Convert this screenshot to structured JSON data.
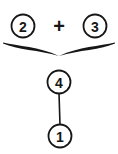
{
  "diagram": {
    "type": "circled-number-tree",
    "background_color": "#ffffff",
    "ink_color": "#161616",
    "canvas": {
      "width": 118,
      "height": 154
    },
    "nodes": [
      {
        "id": "node-2",
        "label": "2",
        "shape": "circle",
        "cx": 23,
        "cy": 26,
        "r": 11.5,
        "stroke_width": 1.8
      },
      {
        "id": "node-3",
        "label": "3",
        "shape": "circle",
        "cx": 95,
        "cy": 26,
        "r": 11.5,
        "stroke_width": 1.8
      },
      {
        "id": "node-4",
        "label": "4",
        "shape": "circle",
        "cx": 59,
        "cy": 82,
        "r": 11.5,
        "stroke_width": 1.8
      },
      {
        "id": "node-1",
        "label": "1",
        "shape": "circle",
        "cx": 60,
        "cy": 136,
        "r": 11.5,
        "stroke_width": 1.8
      }
    ],
    "operators": [
      {
        "id": "plus-operator",
        "label": "+",
        "x": 59,
        "y": 26
      }
    ],
    "brace": {
      "id": "grouping-brace",
      "orientation": "down",
      "left_x": 3,
      "right_x": 115,
      "top_y": 43,
      "tip_x": 59,
      "tip_y": 56
    },
    "connectors": [
      {
        "id": "edge-4-to-1",
        "from": "node-4",
        "to": "node-1",
        "x1": 59,
        "y1": 93,
        "x2": 60,
        "y2": 125,
        "stroke_width": 1.6
      }
    ],
    "font_sizes": {
      "node_label": 14,
      "operator_label": 20
    }
  }
}
